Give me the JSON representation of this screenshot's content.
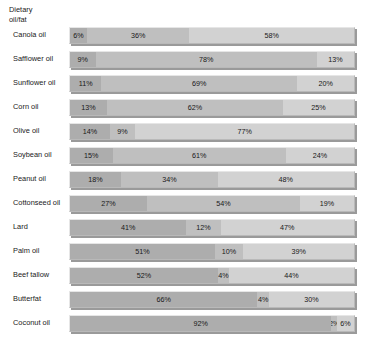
{
  "header": {
    "column_title": "Dietary\noil/fat"
  },
  "chart_data": {
    "type": "bar",
    "subtype": "stacked-horizontal-100pct",
    "title": "",
    "xlabel": "",
    "ylabel": "Dietary oil/fat",
    "xlim": [
      0,
      100
    ],
    "grid": false,
    "legend": "none",
    "stacked": true,
    "units": "%",
    "categories": [
      "Canola oil",
      "Safflower oil",
      "Sunflower oil",
      "Corn oil",
      "Olive oil",
      "Soybean oil",
      "Peanut oil",
      "Cottonseed oil",
      "Lard",
      "Palm oil",
      "Beef tallow",
      "Butterfat",
      "Coconut oil"
    ],
    "series": [
      {
        "name": "segment-1",
        "color": "#adadad",
        "values": [
          6,
          9,
          11,
          13,
          14,
          15,
          18,
          27,
          41,
          51,
          52,
          66,
          92
        ]
      },
      {
        "name": "segment-2",
        "color": "#bfbfbf",
        "values": [
          36,
          78,
          69,
          62,
          9,
          61,
          34,
          54,
          12,
          10,
          4,
          4,
          2
        ]
      },
      {
        "name": "segment-3",
        "color": "#d2d2d2",
        "values": [
          58,
          13,
          20,
          25,
          77,
          24,
          48,
          19,
          47,
          39,
          44,
          30,
          6
        ]
      }
    ],
    "rows": [
      {
        "label": "Canola oil",
        "segments": [
          {
            "value": 6,
            "text": "6%"
          },
          {
            "value": 36,
            "text": "36%"
          },
          {
            "value": 58,
            "text": "58%"
          }
        ]
      },
      {
        "label": "Safflower oil",
        "segments": [
          {
            "value": 9,
            "text": "9%"
          },
          {
            "value": 78,
            "text": "78%"
          },
          {
            "value": 13,
            "text": "13%"
          }
        ]
      },
      {
        "label": "Sunflower oil",
        "segments": [
          {
            "value": 11,
            "text": "11%"
          },
          {
            "value": 69,
            "text": "69%"
          },
          {
            "value": 20,
            "text": "20%"
          }
        ]
      },
      {
        "label": "Corn oil",
        "segments": [
          {
            "value": 13,
            "text": "13%"
          },
          {
            "value": 62,
            "text": "62%"
          },
          {
            "value": 25,
            "text": "25%"
          }
        ]
      },
      {
        "label": "Olive oil",
        "segments": [
          {
            "value": 14,
            "text": "14%"
          },
          {
            "value": 9,
            "text": "9%"
          },
          {
            "value": 77,
            "text": "77%"
          }
        ]
      },
      {
        "label": "Soybean oil",
        "segments": [
          {
            "value": 15,
            "text": "15%"
          },
          {
            "value": 61,
            "text": "61%"
          },
          {
            "value": 24,
            "text": "24%"
          }
        ]
      },
      {
        "label": "Peanut oil",
        "segments": [
          {
            "value": 18,
            "text": "18%"
          },
          {
            "value": 34,
            "text": "34%"
          },
          {
            "value": 48,
            "text": "48%"
          }
        ]
      },
      {
        "label": "Cottonseed oil",
        "segments": [
          {
            "value": 27,
            "text": "27%"
          },
          {
            "value": 54,
            "text": "54%"
          },
          {
            "value": 19,
            "text": "19%"
          }
        ]
      },
      {
        "label": "Lard",
        "segments": [
          {
            "value": 41,
            "text": "41%"
          },
          {
            "value": 12,
            "text": "12%"
          },
          {
            "value": 47,
            "text": "47%"
          }
        ]
      },
      {
        "label": "Palm oil",
        "segments": [
          {
            "value": 51,
            "text": "51%"
          },
          {
            "value": 10,
            "text": "10%"
          },
          {
            "value": 39,
            "text": "39%"
          }
        ]
      },
      {
        "label": "Beef tallow",
        "segments": [
          {
            "value": 52,
            "text": "52%"
          },
          {
            "value": 4,
            "text": "4%"
          },
          {
            "value": 44,
            "text": "44%"
          }
        ]
      },
      {
        "label": "Butterfat",
        "segments": [
          {
            "value": 66,
            "text": "66%"
          },
          {
            "value": 4,
            "text": "4%"
          },
          {
            "value": 30,
            "text": "30%"
          }
        ]
      },
      {
        "label": "Coconut oil",
        "segments": [
          {
            "value": 92,
            "text": "92%"
          },
          {
            "value": 2,
            "text": "2%"
          },
          {
            "value": 6,
            "text": "6%"
          }
        ]
      }
    ]
  }
}
